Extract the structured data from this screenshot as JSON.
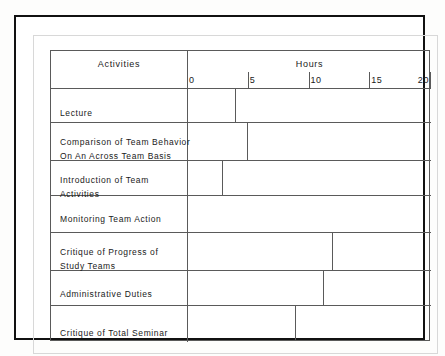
{
  "figure": {
    "title": "",
    "columns": {
      "activities_header": "Activities",
      "hours_header": "Hours"
    }
  },
  "chart_data": {
    "type": "bar",
    "orientation": "horizontal",
    "title": "",
    "xlabel": "Hours",
    "ylabel": "Activities",
    "xlim": [
      0,
      20
    ],
    "ticks": [
      {
        "value": 0,
        "label": "0"
      },
      {
        "value": 5,
        "label": "5"
      },
      {
        "value": 10,
        "label": "10"
      },
      {
        "value": 15,
        "label": "15"
      },
      {
        "value": 20,
        "label": "20"
      }
    ],
    "grid": false,
    "legend": null,
    "categories": [
      "Lecture",
      "Comparison of Team Behavior On An Across Team Basis",
      "Introduction of Team Activities",
      "Monitoring Team Action",
      "Critique of Progress of Study Teams",
      "Administrative Duties",
      "Critique of Total Seminar"
    ],
    "values": [
      4,
      5,
      3,
      20,
      12,
      11.3,
      9
    ]
  },
  "rows": [
    {
      "label_lines": [
        "Lecture"
      ],
      "value": 4,
      "bar_style": "open-rect"
    },
    {
      "label_lines": [
        "Comparison of  Team  Behavior",
        "On An Across  Team  Basis"
      ],
      "value": 5,
      "bar_style": "open-rect"
    },
    {
      "label_lines": [
        "Introduction of  Team",
        "Activities"
      ],
      "value": 3,
      "bar_style": "open-rect"
    },
    {
      "label_lines": [
        "Monitoring  Team  Action"
      ],
      "value": 20,
      "bar_style": "open-rect"
    },
    {
      "label_lines": [
        "Critique of Progress of",
        "Study Teams"
      ],
      "value": 12,
      "bar_style": "open-rect"
    },
    {
      "label_lines": [
        "Administrative Duties"
      ],
      "value": 11.3,
      "bar_style": "open-rect"
    },
    {
      "label_lines": [
        "Critique of  Total  Seminar"
      ],
      "value": 9,
      "bar_style": "open-rect"
    }
  ],
  "colors": {
    "line": "#5a5a5a",
    "frame": "#111111",
    "text": "#1a1a1a",
    "background": "#ffffff"
  }
}
